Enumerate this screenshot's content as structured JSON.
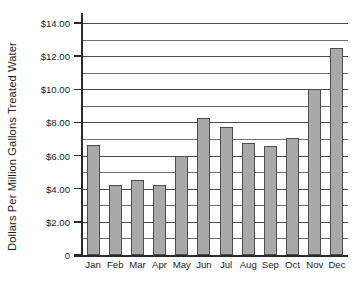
{
  "chart_data": {
    "type": "bar",
    "title": "",
    "subtitle": "",
    "xlabel": "",
    "ylabel": "Dollars Per Million Gallons Treated Water",
    "categories": [
      "Jan",
      "Feb",
      "Mar",
      "Apr",
      "May",
      "Jun",
      "Jul",
      "Aug",
      "Sep",
      "Oct",
      "Nov",
      "Dec"
    ],
    "values": [
      6.65,
      4.25,
      4.5,
      4.2,
      5.95,
      8.25,
      7.75,
      6.75,
      6.6,
      7.05,
      10.0,
      12.5
    ],
    "ylim": [
      0,
      14
    ],
    "y_major_ticks": [
      0,
      2,
      4,
      6,
      8,
      10,
      12,
      14
    ],
    "y_tick_labels": [
      "0",
      "$2.00",
      "$4.00",
      "$6.00",
      "$8.00",
      "$10.00",
      "$12.00",
      "$14.00"
    ],
    "y_gridline_values": [
      1,
      2,
      3,
      4,
      5,
      6,
      7,
      8,
      9,
      10,
      11,
      12,
      13,
      14
    ],
    "grid": true,
    "legend": false,
    "bar_color": "#a9a9a9",
    "bar_edge_color": "#4d4d4d",
    "axis_color": "#2b2b2b",
    "grid_color": "#4a4a4a",
    "background_color": "#ffffff"
  }
}
